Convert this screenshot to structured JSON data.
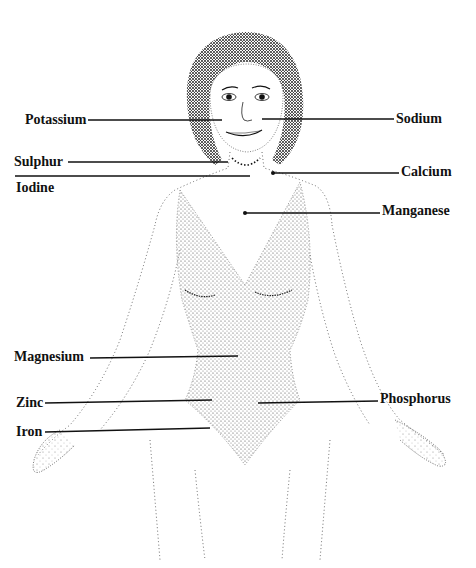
{
  "diagram": {
    "title": "",
    "labels": [
      {
        "id": "potassium",
        "text": "Potassium",
        "side": "left",
        "x": 25,
        "y": 112,
        "line": [
          88,
          120,
          222,
          120
        ]
      },
      {
        "id": "sodium",
        "text": "Sodium",
        "side": "right",
        "x": 396,
        "y": 111,
        "line": [
          262,
          119,
          394,
          119
        ]
      },
      {
        "id": "sulphur",
        "text": "Sulphur",
        "side": "left",
        "x": 14,
        "y": 154,
        "line": [
          68,
          162,
          228,
          162
        ]
      },
      {
        "id": "iodine",
        "text": "Iodine",
        "side": "left",
        "x": 16,
        "y": 180,
        "line": [
          15,
          176,
          250,
          176
        ]
      },
      {
        "id": "calcium",
        "text": "Calcium",
        "side": "right",
        "x": 401,
        "y": 164,
        "line": [
          273,
          173,
          399,
          173
        ]
      },
      {
        "id": "manganese",
        "text": "Manganese",
        "side": "right",
        "x": 382,
        "y": 203,
        "line": [
          245,
          213,
          380,
          213
        ]
      },
      {
        "id": "magnesium",
        "text": "Magnesium",
        "side": "left",
        "x": 14,
        "y": 349,
        "line": [
          90,
          358,
          238,
          356
        ]
      },
      {
        "id": "zinc",
        "text": "Zinc",
        "side": "left",
        "x": 16,
        "y": 395,
        "line": [
          45,
          403,
          212,
          400
        ]
      },
      {
        "id": "phosphorus",
        "text": "Phosphorus",
        "side": "right",
        "x": 380,
        "y": 391,
        "line": [
          258,
          403,
          378,
          401
        ]
      },
      {
        "id": "iron",
        "text": "Iron",
        "side": "left",
        "x": 16,
        "y": 424,
        "line": [
          45,
          432,
          210,
          428
        ]
      }
    ]
  }
}
